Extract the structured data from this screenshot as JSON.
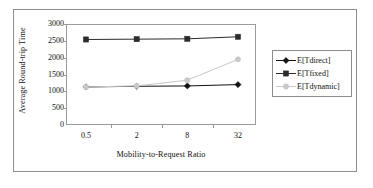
{
  "figure": {
    "name": "average-round-trip-time-vs-mobility-to-request-ratio"
  },
  "chart_data": {
    "type": "line",
    "title": "",
    "xlabel": "Mobility-to-Request Ratio",
    "ylabel": "Average Round-trip Time",
    "categories": [
      "0.5",
      "2",
      "8",
      "32"
    ],
    "ylim": [
      0,
      3000
    ],
    "yticks": [
      "0",
      "500",
      "1000",
      "1500",
      "2000",
      "2500",
      "3000"
    ],
    "grid": false,
    "legend_position": "right",
    "series": [
      {
        "name": "E[Tdirect]",
        "marker": "diamond",
        "color": "#111111",
        "values": [
          1130,
          1150,
          1160,
          1200
        ]
      },
      {
        "name": "E[Tfixed]",
        "marker": "square",
        "color": "#2b2b2b",
        "values": [
          2540,
          2550,
          2560,
          2620
        ]
      },
      {
        "name": "E[Tdynamic]",
        "marker": "circle",
        "color": "#c8c8c8",
        "values": [
          1130,
          1160,
          1330,
          1950
        ]
      }
    ]
  },
  "legend": {
    "items": [
      {
        "label": "E[Tdirect]"
      },
      {
        "label": "E[Tfixed]"
      },
      {
        "label": "E[Tdynamic]"
      }
    ]
  },
  "axes": {
    "y_title": "Average Round-trip Time",
    "x_title": "Mobility-to-Request Ratio",
    "y_tick_labels": [
      "3000",
      "2500",
      "2000",
      "1500",
      "1000",
      "500",
      "0"
    ],
    "x_tick_labels": [
      "0.5",
      "2",
      "8",
      "32"
    ]
  }
}
